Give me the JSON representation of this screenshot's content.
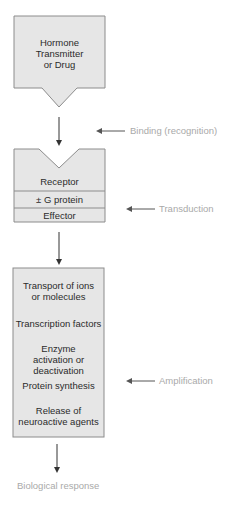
{
  "diagram": {
    "colors": {
      "box_fill": "#e6e6e6",
      "box_stroke": "#8c8c8c",
      "arrow": "#333333",
      "label": "#a9a9a9",
      "text": "#2b2b2b"
    },
    "ligand_box": {
      "lines": [
        "Hormone",
        "Transmitter",
        "or Drug"
      ]
    },
    "receptor_box": {
      "sections": [
        "Receptor",
        "± G protein",
        "Effector"
      ]
    },
    "effects_box": {
      "items": [
        "Transport of ions or molecules",
        "Transcription factors",
        "Enzyme activation or deactivation",
        "Protein synthesis",
        "Release of neuroactive agents"
      ]
    },
    "stage_labels": {
      "binding": "Binding (recognition)",
      "transduction": "Transduction",
      "amplification": "Amplification"
    },
    "output": "Biological response"
  }
}
